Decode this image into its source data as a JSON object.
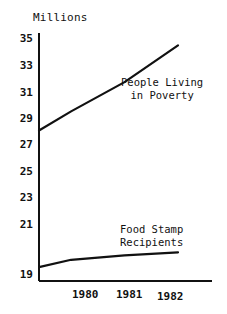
{
  "chart_data": {
    "type": "line",
    "title": "",
    "ylabel": "Millions",
    "xlabel": "",
    "grid": false,
    "legend_position": "inline-annotations",
    "ylim": [
      19,
      35
    ],
    "yticks": [
      35,
      33,
      31,
      29,
      27,
      25,
      23,
      21,
      19
    ],
    "ytick_labels": [
      "35",
      "33",
      "31",
      "29",
      "27",
      "25",
      "23",
      "21",
      "19"
    ],
    "categories": [
      "1980",
      "1981",
      "1982"
    ],
    "xtick_labels": [
      "1980",
      "1981",
      "1982"
    ],
    "series": [
      {
        "name": "People Living in Poverty",
        "label_line_1": "People Living",
        "label_line_2": "in Poverty",
        "x": [
          1979.4,
          1980,
          1981,
          1982
        ],
        "values": [
          28.7,
          30.0,
          32.0,
          34.5
        ]
      },
      {
        "name": "Food Stamp Recipients",
        "label_line_1": "Food Stamp",
        "label_line_2": "Recipients",
        "x": [
          1979.4,
          1980,
          1981,
          1982
        ],
        "values": [
          19.4,
          19.9,
          20.2,
          20.4
        ]
      }
    ]
  },
  "axis": {
    "y_title": "Millions"
  },
  "yticks": {
    "t0": "35",
    "t1": "33",
    "t2": "31",
    "t3": "29",
    "t4": "27",
    "t5": "25",
    "t6": "23",
    "t7": "21",
    "t8": "19"
  },
  "xticks": {
    "t0": "1980",
    "t1": "1981",
    "t2": "1982"
  },
  "annotations": {
    "poverty_line1": "People Living",
    "poverty_line2": "in Poverty",
    "foodstamp_line1": "Food Stamp",
    "foodstamp_line2": "Recipients"
  },
  "colors": {
    "ink": "#111111",
    "background": "#ffffff"
  }
}
